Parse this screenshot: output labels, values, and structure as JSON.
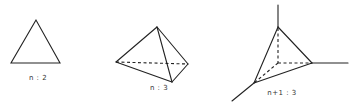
{
  "figures": [
    {
      "id": "simplex-2",
      "kind": "triangle",
      "label": "n : 2"
    },
    {
      "id": "simplex-3",
      "kind": "tetrahedron",
      "label": "n : 3"
    },
    {
      "id": "cone-3",
      "kind": "tetrahedron-with-axes",
      "label": "n+1 : 3"
    }
  ]
}
